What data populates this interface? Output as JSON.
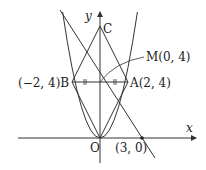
{
  "diagram": {
    "axes": {
      "x_label": "x",
      "y_label": "y",
      "origin_label": "O"
    },
    "points": {
      "C": {
        "label": "C"
      },
      "B": {
        "label": "(−2, 4)B"
      },
      "A": {
        "label": "A(2, 4)"
      },
      "M": {
        "label": "M(0, 4)"
      },
      "P": {
        "label": "(3, 0)"
      }
    },
    "colors": {
      "stroke": "#333333",
      "background": "#ffffff"
    }
  }
}
